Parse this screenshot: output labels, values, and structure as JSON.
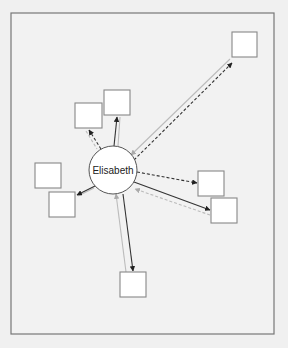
{
  "diagram": {
    "type": "ego-network",
    "center_node": {
      "label": "Elisabeth",
      "cx": 113,
      "cy": 170,
      "r": 24
    },
    "frame": {
      "x": 11,
      "y": 13,
      "w": 263,
      "h": 321
    },
    "nodes": [
      {
        "id": "n1",
        "x": 232,
        "y": 32,
        "w": 25,
        "h": 25
      },
      {
        "id": "n2",
        "x": 75,
        "y": 103,
        "w": 27,
        "h": 25
      },
      {
        "id": "n3",
        "x": 104,
        "y": 90,
        "w": 26,
        "h": 25
      },
      {
        "id": "n4",
        "x": 35,
        "y": 163,
        "w": 26,
        "h": 25
      },
      {
        "id": "n5",
        "x": 49,
        "y": 192,
        "w": 26,
        "h": 25
      },
      {
        "id": "n6",
        "x": 198,
        "y": 171,
        "w": 26,
        "h": 25
      },
      {
        "id": "n7",
        "x": 211,
        "y": 198,
        "w": 26,
        "h": 25
      },
      {
        "id": "n8",
        "x": 120,
        "y": 272,
        "w": 26,
        "h": 25
      }
    ],
    "edges": [
      {
        "to": "n1",
        "style": "dashed",
        "dir": "out"
      },
      {
        "to": "n1",
        "style": "gray-solid",
        "dir": "in"
      },
      {
        "to": "n2",
        "style": "dashed",
        "dir": "out"
      },
      {
        "to": "n3",
        "style": "solid",
        "dir": "out"
      },
      {
        "to": "n5",
        "style": "solid",
        "dir": "out"
      },
      {
        "to": "n5",
        "style": "gray-solid",
        "dir": "in"
      },
      {
        "to": "n6",
        "style": "dashed",
        "dir": "out"
      },
      {
        "to": "n7",
        "style": "solid",
        "dir": "out"
      },
      {
        "to": "n7",
        "style": "gray-dashed",
        "dir": "in"
      },
      {
        "to": "n8",
        "style": "solid",
        "dir": "out"
      },
      {
        "to": "n8",
        "style": "gray-solid",
        "dir": "in"
      }
    ]
  },
  "colors": {
    "background": "#f0f0f0",
    "frame": "#777777",
    "edge_dark": "#333333",
    "edge_light": "#bbbbbb"
  }
}
